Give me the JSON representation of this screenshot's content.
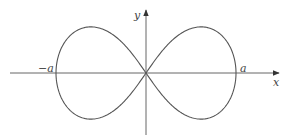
{
  "diagram": {
    "type": "lemniscate",
    "axes": {
      "x_label": "x",
      "y_label": "y"
    },
    "labels": {
      "left_intercept": "−a",
      "right_intercept": "a"
    },
    "colors": {
      "stroke": "#555555",
      "background": "#ffffff"
    }
  }
}
